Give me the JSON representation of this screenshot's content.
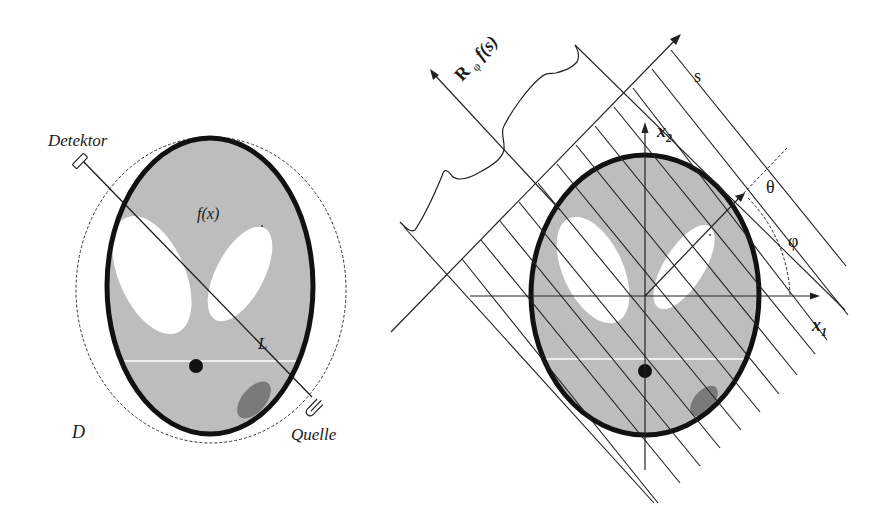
{
  "left_diagram": {
    "labels": {
      "detector": "Detektor",
      "source": "Quelle",
      "function": "f(x)",
      "line": "L",
      "domain": "D"
    }
  },
  "right_diagram": {
    "labels": {
      "projection": "R",
      "projection_sub": "φ",
      "projection_fn": "f(s)",
      "s_axis": "s",
      "x1_axis": "x",
      "x1_sub": "1",
      "x2_axis": "x",
      "x2_sub": "2",
      "theta": "θ",
      "phi": "φ"
    }
  },
  "colors": {
    "phantom_fill": "#bcbcbc",
    "phantom_outline": "#111111",
    "white_region": "#ffffff",
    "dark_ellipse": "#7a7a7a",
    "line": "#222222"
  }
}
